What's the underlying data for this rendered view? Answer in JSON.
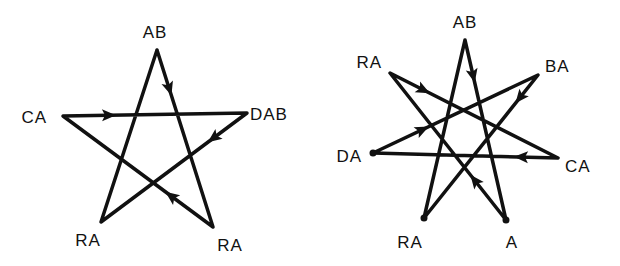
{
  "diagrams": [
    {
      "name": "pentagram",
      "vertices": [
        {
          "id": "top",
          "label": "AB",
          "x": 157,
          "y": 50,
          "lx": 155,
          "ly": 38,
          "anchor": "middle"
        },
        {
          "id": "right",
          "label": "DAB",
          "x": 247,
          "y": 113,
          "lx": 250,
          "ly": 120,
          "anchor": "start"
        },
        {
          "id": "bottom_right",
          "label": "RA",
          "x": 213,
          "y": 227,
          "lx": 230,
          "ly": 251,
          "anchor": "middle"
        },
        {
          "id": "bottom_left",
          "label": "RA",
          "x": 101,
          "y": 222,
          "lx": 88,
          "ly": 246,
          "anchor": "middle"
        },
        {
          "id": "left",
          "label": "CA",
          "x": 63,
          "y": 116,
          "lx": 47,
          "ly": 123,
          "anchor": "end"
        }
      ],
      "path_order": [
        "top",
        "bottom_right",
        "left",
        "right",
        "bottom_left",
        "top"
      ],
      "arrows": [
        {
          "from": "top",
          "to": "bottom_right",
          "t": 0.22
        },
        {
          "from": "left",
          "to": "right",
          "t": 0.25
        },
        {
          "from": "right",
          "to": "bottom_left",
          "t": 0.23
        },
        {
          "from": "bottom_right",
          "to": "left",
          "t": 0.28
        }
      ]
    },
    {
      "name": "heptagram",
      "vertices": [
        {
          "id": "top",
          "label": "AB",
          "x": 465,
          "y": 40,
          "lx": 465,
          "ly": 28,
          "anchor": "middle"
        },
        {
          "id": "upper_right",
          "label": "BA",
          "x": 538,
          "y": 75,
          "lx": 545,
          "ly": 72,
          "anchor": "start"
        },
        {
          "id": "right",
          "label": "CA",
          "x": 558,
          "y": 158,
          "lx": 565,
          "ly": 172,
          "anchor": "start"
        },
        {
          "id": "bottom_right",
          "label": "A",
          "x": 506,
          "y": 220,
          "lx": 512,
          "ly": 248,
          "anchor": "middle"
        },
        {
          "id": "bottom_left",
          "label": "RA",
          "x": 424,
          "y": 218,
          "lx": 410,
          "ly": 248,
          "anchor": "middle"
        },
        {
          "id": "left",
          "label": "DA",
          "x": 373,
          "y": 153,
          "lx": 362,
          "ly": 162,
          "anchor": "end"
        },
        {
          "id": "upper_left",
          "label": "RA",
          "x": 390,
          "y": 73,
          "lx": 382,
          "ly": 68,
          "anchor": "end"
        }
      ],
      "path_order": [
        "top",
        "bottom_right",
        "upper_left",
        "right",
        "left",
        "upper_right",
        "bottom_left",
        "top"
      ],
      "arrows": [
        {
          "from": "top",
          "to": "bottom_right",
          "t": 0.2
        },
        {
          "from": "upper_right",
          "to": "bottom_left",
          "t": 0.16
        },
        {
          "from": "upper_left",
          "to": "right",
          "t": 0.2
        },
        {
          "from": "left",
          "to": "upper_right",
          "t": 0.3
        },
        {
          "from": "right",
          "to": "left",
          "t": 0.2
        },
        {
          "from": "bottom_right",
          "to": "upper_left",
          "t": 0.27
        }
      ],
      "dots": [
        "left",
        "bottom_left",
        "bottom_right"
      ]
    }
  ]
}
